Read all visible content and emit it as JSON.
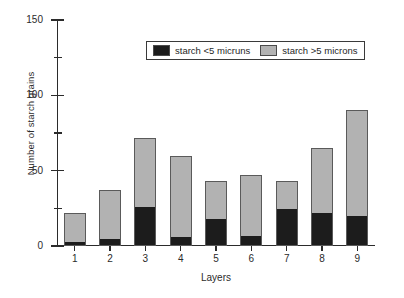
{
  "chart_data": {
    "type": "bar",
    "stacked": true,
    "title": "",
    "xlabel": "Layers",
    "ylabel": "Number of starch grains",
    "categories": [
      "1",
      "2",
      "3",
      "4",
      "5",
      "6",
      "7",
      "8",
      "9"
    ],
    "ylim": [
      0,
      150
    ],
    "yticks": [
      0,
      50,
      100,
      150
    ],
    "ytick_labels": [
      "0",
      "50",
      "100",
      "150"
    ],
    "yminor_ticks": [
      25,
      75,
      125
    ],
    "grid": false,
    "legend_position": "top-center",
    "series": [
      {
        "name": "starch <5 micruns",
        "color": "#1c1c1c",
        "values": [
          2,
          4,
          25,
          5,
          17,
          6,
          24,
          21,
          19
        ]
      },
      {
        "name": "starch >5 microns",
        "color": "#b2b2b2",
        "values": [
          20,
          33,
          47,
          55,
          26,
          41,
          19,
          44,
          71
        ]
      }
    ],
    "totals": [
      22,
      37,
      72,
      60,
      43,
      47,
      43,
      65,
      90
    ]
  },
  "legend": {
    "entries": [
      {
        "label": "starch <5 micruns",
        "swatch": "dark-swatch"
      },
      {
        "label": "starch >5 microns",
        "swatch": "light-swatch"
      }
    ]
  }
}
